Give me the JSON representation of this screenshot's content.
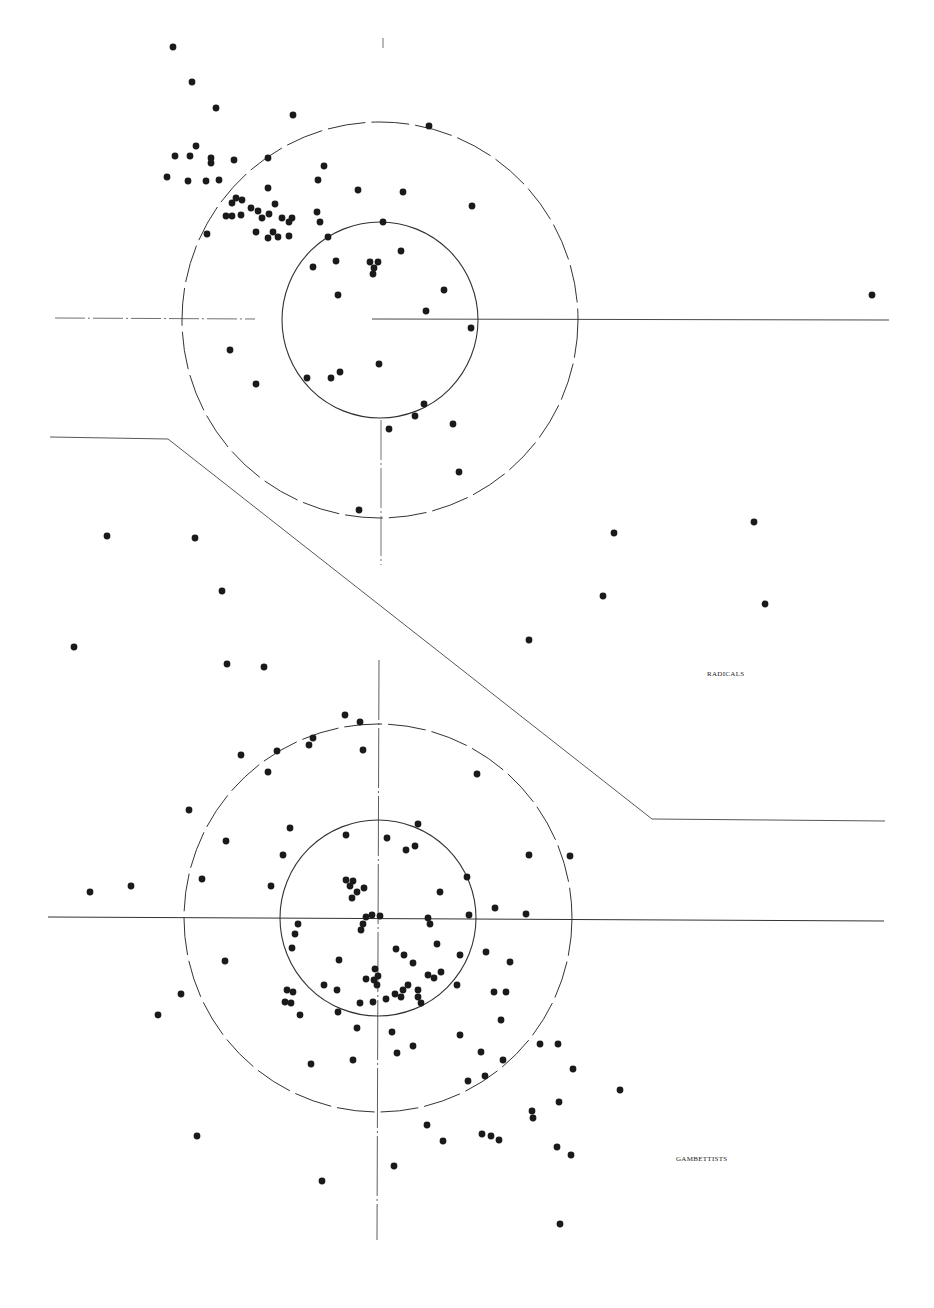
{
  "chart_data": {
    "type": "scatter",
    "title": "",
    "xlabel": "",
    "ylabel": "",
    "grid": false,
    "legend": "none",
    "groups": [
      {
        "name": "RADICALS",
        "label_pos": [
          707,
          675
        ],
        "center": [
          380,
          320
        ],
        "inner_radius": 98,
        "outer_radius": 198,
        "points": [
          [
            173,
            47
          ],
          [
            192,
            82
          ],
          [
            216,
            108
          ],
          [
            293,
            115
          ],
          [
            429,
            126
          ],
          [
            175,
            156
          ],
          [
            190,
            156
          ],
          [
            196,
            146
          ],
          [
            211,
            158
          ],
          [
            211,
            163
          ],
          [
            234,
            160
          ],
          [
            268,
            158
          ],
          [
            167,
            177
          ],
          [
            188,
            181
          ],
          [
            206,
            181
          ],
          [
            219,
            180
          ],
          [
            324,
            166
          ],
          [
            318,
            180
          ],
          [
            358,
            190
          ],
          [
            403,
            192
          ],
          [
            472,
            206
          ],
          [
            232,
            203
          ],
          [
            236,
            198
          ],
          [
            242,
            200
          ],
          [
            268,
            188
          ],
          [
            275,
            204
          ],
          [
            226,
            216
          ],
          [
            232,
            216
          ],
          [
            241,
            215
          ],
          [
            251,
            208
          ],
          [
            258,
            211
          ],
          [
            262,
            218
          ],
          [
            269,
            214
          ],
          [
            282,
            218
          ],
          [
            289,
            222
          ],
          [
            292,
            218
          ],
          [
            273,
            232
          ],
          [
            256,
            232
          ],
          [
            268,
            238
          ],
          [
            278,
            237
          ],
          [
            289,
            236
          ],
          [
            317,
            212
          ],
          [
            320,
            222
          ],
          [
            207,
            234
          ],
          [
            328,
            237
          ],
          [
            383,
            222
          ],
          [
            401,
            251
          ],
          [
            313,
            267
          ],
          [
            336,
            261
          ],
          [
            370,
            262
          ],
          [
            378,
            262
          ],
          [
            374,
            268
          ],
          [
            373,
            274
          ],
          [
            338,
            295
          ],
          [
            444,
            290
          ],
          [
            426,
            311
          ],
          [
            471,
            328
          ],
          [
            230,
            350
          ],
          [
            256,
            384
          ],
          [
            307,
            378
          ],
          [
            331,
            378
          ],
          [
            340,
            372
          ],
          [
            379,
            364
          ],
          [
            424,
            404
          ],
          [
            415,
            416
          ],
          [
            389,
            429
          ],
          [
            453,
            424
          ],
          [
            459,
            472
          ],
          [
            359,
            510
          ],
          [
            872,
            295
          ]
        ]
      },
      {
        "name": "Between",
        "points": [
          [
            107,
            536
          ],
          [
            195,
            538
          ],
          [
            222,
            591
          ],
          [
            74,
            647
          ],
          [
            227,
            664
          ],
          [
            264,
            667
          ],
          [
            614,
            533
          ],
          [
            754,
            522
          ],
          [
            603,
            596
          ],
          [
            765,
            604
          ],
          [
            529,
            640
          ]
        ]
      },
      {
        "name": "GAMBETTISTS",
        "label_pos": [
          676,
          1160
        ],
        "center": [
          378,
          918
        ],
        "inner_radius": 98,
        "outer_radius": 194,
        "points": [
          [
            345,
            715
          ],
          [
            360,
            722
          ],
          [
            313,
            738
          ],
          [
            309,
            745
          ],
          [
            277,
            751
          ],
          [
            241,
            755
          ],
          [
            363,
            750
          ],
          [
            268,
            772
          ],
          [
            477,
            774
          ],
          [
            189,
            810
          ],
          [
            290,
            828
          ],
          [
            226,
            841
          ],
          [
            418,
            824
          ],
          [
            346,
            835
          ],
          [
            387,
            838
          ],
          [
            406,
            850
          ],
          [
            415,
            846
          ],
          [
            283,
            855
          ],
          [
            529,
            855
          ],
          [
            570,
            856
          ],
          [
            202,
            879
          ],
          [
            271,
            886
          ],
          [
            90,
            892
          ],
          [
            131,
            886
          ],
          [
            346,
            880
          ],
          [
            353,
            881
          ],
          [
            350,
            886
          ],
          [
            357,
            892
          ],
          [
            352,
            898
          ],
          [
            364,
            888
          ],
          [
            467,
            877
          ],
          [
            440,
            892
          ],
          [
            495,
            908
          ],
          [
            526,
            914
          ],
          [
            298,
            924
          ],
          [
            295,
            934
          ],
          [
            292,
            948
          ],
          [
            366,
            917
          ],
          [
            372,
            915
          ],
          [
            380,
            916
          ],
          [
            363,
            924
          ],
          [
            361,
            930
          ],
          [
            428,
            918
          ],
          [
            430,
            924
          ],
          [
            469,
            915
          ],
          [
            225,
            961
          ],
          [
            339,
            960
          ],
          [
            324,
            985
          ],
          [
            337,
            990
          ],
          [
            396,
            949
          ],
          [
            404,
            955
          ],
          [
            413,
            963
          ],
          [
            375,
            969
          ],
          [
            378,
            976
          ],
          [
            374,
            980
          ],
          [
            377,
            985
          ],
          [
            366,
            979
          ],
          [
            360,
            1003
          ],
          [
            373,
            1002
          ],
          [
            386,
            999
          ],
          [
            395,
            994
          ],
          [
            403,
            990
          ],
          [
            401,
            997
          ],
          [
            408,
            985
          ],
          [
            418,
            990
          ],
          [
            428,
            975
          ],
          [
            434,
            978
          ],
          [
            418,
            997
          ],
          [
            421,
            1003
          ],
          [
            287,
            990
          ],
          [
            293,
            992
          ],
          [
            285,
            1002
          ],
          [
            291,
            1003
          ],
          [
            300,
            1015
          ],
          [
            437,
            944
          ],
          [
            441,
            972
          ],
          [
            457,
            985
          ],
          [
            460,
            955
          ],
          [
            486,
            952
          ],
          [
            510,
            962
          ],
          [
            494,
            992
          ],
          [
            506,
            992
          ],
          [
            501,
            1020
          ],
          [
            181,
            994
          ],
          [
            158,
            1015
          ],
          [
            338,
            1012
          ],
          [
            357,
            1028
          ],
          [
            392,
            1032
          ],
          [
            413,
            1046
          ],
          [
            397,
            1053
          ],
          [
            460,
            1035
          ],
          [
            353,
            1060
          ],
          [
            311,
            1064
          ],
          [
            481,
            1052
          ],
          [
            503,
            1060
          ],
          [
            485,
            1076
          ],
          [
            468,
            1081
          ],
          [
            540,
            1044
          ],
          [
            558,
            1044
          ],
          [
            573,
            1069
          ],
          [
            620,
            1090
          ],
          [
            197,
            1136
          ],
          [
            427,
            1125
          ],
          [
            443,
            1141
          ],
          [
            482,
            1134
          ],
          [
            491,
            1136
          ],
          [
            499,
            1140
          ],
          [
            532,
            1111
          ],
          [
            533,
            1118
          ],
          [
            559,
            1102
          ],
          [
            557,
            1147
          ],
          [
            571,
            1155
          ],
          [
            394,
            1166
          ],
          [
            322,
            1181
          ],
          [
            560,
            1224
          ]
        ]
      }
    ],
    "annotations": [
      "RADICALS",
      "GAMBETTISTS"
    ]
  },
  "labels": {
    "radicals": "RADICALS",
    "gambettists": "GAMBETTISTS"
  },
  "style": {
    "ink": "#1a1a1a",
    "line": "#333333",
    "background": "#ffffff"
  }
}
